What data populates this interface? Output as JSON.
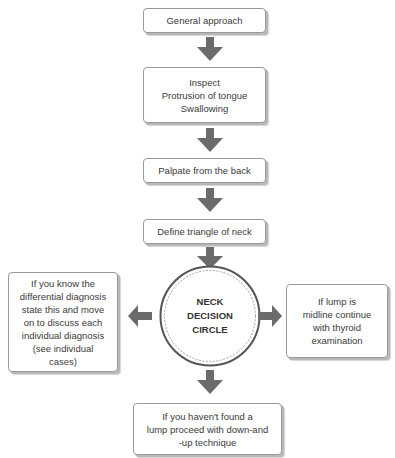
{
  "diagram": {
    "type": "flowchart",
    "colors": {
      "arrow": "#6b6b6b",
      "box_border": "#9a9a9a",
      "box_shadow": "#b8b8b8",
      "circle_stroke": "#555555",
      "text": "#3a3a3a"
    },
    "steps": [
      {
        "id": "general-approach",
        "label": "General approach"
      },
      {
        "id": "inspect",
        "label": "Inspect\nProtrusion of tongue\nSwallowing"
      },
      {
        "id": "palpate",
        "label": "Palpate from the back"
      },
      {
        "id": "define-triangle",
        "label": "Define triangle of neck"
      }
    ],
    "decision": {
      "label": "NECK\nDECISION\nCIRCLE"
    },
    "branches": {
      "left": {
        "label": "If you know the\ndifferential diagnosis\nstate this and move\non to discuss each\nindividual diagnosis\n(see individual\ncases)"
      },
      "right": {
        "label": "If lump is\nmidline continue\nwith thyroid\nexamination"
      },
      "bottom": {
        "label": "If you haven't found a\nlump proceed with down-and\n-up technique"
      }
    },
    "edges": [
      {
        "from": "general-approach",
        "to": "inspect",
        "direction": "down"
      },
      {
        "from": "inspect",
        "to": "palpate",
        "direction": "down"
      },
      {
        "from": "palpate",
        "to": "define-triangle",
        "direction": "down"
      },
      {
        "from": "define-triangle",
        "to": "decision",
        "direction": "down"
      },
      {
        "from": "decision",
        "to": "left",
        "direction": "left"
      },
      {
        "from": "decision",
        "to": "right",
        "direction": "right"
      },
      {
        "from": "decision",
        "to": "bottom",
        "direction": "down"
      }
    ]
  }
}
